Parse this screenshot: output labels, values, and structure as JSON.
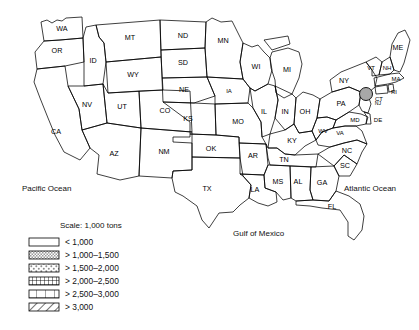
{
  "figure": {
    "type": "choropleth-map",
    "region": "United States (48 contiguous states)",
    "scale_title": "Scale: 1,000 tons",
    "ocean_labels": {
      "pacific": "Pacific Ocean",
      "atlantic": "Atlantic Ocean",
      "gulf": "Gulf of Mexico"
    }
  },
  "legend": {
    "title": "Scale: 1,000 tons",
    "entries": [
      {
        "key": "c1",
        "label": "< 1,000",
        "pattern": "blank",
        "color": "#ffffff"
      },
      {
        "key": "c2",
        "label": "> 1,000–1,500",
        "pattern": "stipple",
        "color": "#b5b5b5"
      },
      {
        "key": "c3",
        "label": "> 1,500–2,000",
        "pattern": "coarse-dots",
        "color": "#cccccc"
      },
      {
        "key": "c4",
        "label": "> 2,000–2,500",
        "pattern": "fine-grid",
        "color": "#8f8f8f"
      },
      {
        "key": "c5",
        "label": "> 2,500–3,000",
        "pattern": "coarse-grid",
        "color": "#ffffff"
      },
      {
        "key": "c6",
        "label": "> 3,000",
        "pattern": "diagonal",
        "color": "#ffffff"
      }
    ]
  },
  "states": [
    {
      "code": "WA",
      "cls": "c1"
    },
    {
      "code": "OR",
      "cls": "c1"
    },
    {
      "code": "CA",
      "cls": "c6"
    },
    {
      "code": "ID",
      "cls": "c1"
    },
    {
      "code": "NV",
      "cls": "c1"
    },
    {
      "code": "MT",
      "cls": "c1"
    },
    {
      "code": "WY",
      "cls": "c1"
    },
    {
      "code": "UT",
      "cls": "c1"
    },
    {
      "code": "CO",
      "cls": "c2"
    },
    {
      "code": "AZ",
      "cls": "c2"
    },
    {
      "code": "NM",
      "cls": "c1"
    },
    {
      "code": "ND",
      "cls": "c1"
    },
    {
      "code": "SD",
      "cls": "c1"
    },
    {
      "code": "NE",
      "cls": "c1"
    },
    {
      "code": "KS",
      "cls": "c1"
    },
    {
      "code": "OK",
      "cls": "c1"
    },
    {
      "code": "TX",
      "cls": "c6"
    },
    {
      "code": "MN",
      "cls": "c1"
    },
    {
      "code": "IA",
      "cls": "c2"
    },
    {
      "code": "MO",
      "cls": "c2"
    },
    {
      "code": "AR",
      "cls": "c1"
    },
    {
      "code": "LA",
      "cls": "c2"
    },
    {
      "code": "WI",
      "cls": "c2"
    },
    {
      "code": "IL",
      "cls": "c5"
    },
    {
      "code": "MI",
      "cls": "c4"
    },
    {
      "code": "IN",
      "cls": "c2"
    },
    {
      "code": "OH",
      "cls": "c4"
    },
    {
      "code": "KY",
      "cls": "c1"
    },
    {
      "code": "TN",
      "cls": "c1"
    },
    {
      "code": "MS",
      "cls": "c1"
    },
    {
      "code": "AL",
      "cls": "c1"
    },
    {
      "code": "GA",
      "cls": "c3"
    },
    {
      "code": "FL",
      "cls": "c4"
    },
    {
      "code": "SC",
      "cls": "c1"
    },
    {
      "code": "NC",
      "cls": "c4"
    },
    {
      "code": "VA",
      "cls": "c2"
    },
    {
      "code": "WV",
      "cls": "c2"
    },
    {
      "code": "PA",
      "cls": "c3"
    },
    {
      "code": "NY",
      "cls": "c1"
    },
    {
      "code": "MD",
      "cls": "c2"
    },
    {
      "code": "DE",
      "cls": "c1"
    },
    {
      "code": "NJ",
      "cls": "c2"
    },
    {
      "code": "CT",
      "cls": "c1"
    },
    {
      "code": "RI",
      "cls": "c1"
    },
    {
      "code": "MA",
      "cls": "c1"
    },
    {
      "code": "VT",
      "cls": "c1"
    },
    {
      "code": "NH",
      "cls": "c1"
    },
    {
      "code": "ME",
      "cls": "c1"
    }
  ],
  "labels": {
    "WA": "WA",
    "OR": "OR",
    "CA": "CA",
    "ID": "ID",
    "NV": "NV",
    "MT": "MT",
    "WY": "WY",
    "UT": "UT",
    "CO": "CO",
    "AZ": "AZ",
    "NM": "NM",
    "ND": "ND",
    "SD": "SD",
    "NE": "NE",
    "KS": "KS",
    "OK": "OK",
    "TX": "TX",
    "MN": "MN",
    "IA": "IA",
    "MO": "MO",
    "AR": "AR",
    "LA": "LA",
    "WI": "WI",
    "IL": "IL",
    "MI": "MI",
    "IN": "IN",
    "OH": "OH",
    "KY": "KY",
    "TN": "TN",
    "MS": "MS",
    "AL": "AL",
    "GA": "GA",
    "FL": "FL",
    "SC": "SC",
    "NC": "NC",
    "VA": "VA",
    "WV": "WV",
    "PA": "PA",
    "NY": "NY",
    "MD": "MD",
    "DE": "DE",
    "NJ": "NJ",
    "CT": "CT",
    "RI": "RI",
    "MA": "MA",
    "VT": "VT",
    "NH": "NH",
    "ME": "ME"
  }
}
